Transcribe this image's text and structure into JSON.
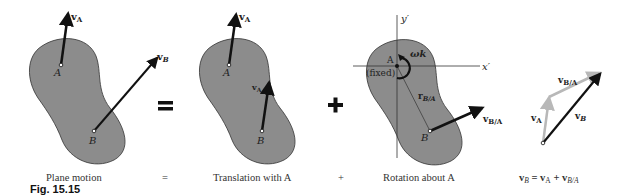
{
  "figure": {
    "number_label": "Fig. 15.15",
    "body_fill": "#8c8c8c",
    "arrow_color": "#111111",
    "gray_arrow_color": "#b8b8b8"
  },
  "panels": [
    {
      "caption": "Plane motion",
      "labels": {
        "point_a": "A",
        "point_b": "B",
        "va": "v",
        "va_sub": "A",
        "vb": "v",
        "vb_sub": "B"
      }
    },
    {
      "caption": "Translation with A",
      "labels": {
        "point_a": "A",
        "point_b": "B",
        "va": "v",
        "va_sub": "A",
        "va2": "v",
        "va2_sub": "A"
      }
    },
    {
      "caption": "Rotation about A",
      "labels": {
        "point_a": "A",
        "point_b": "B",
        "fixed": "(fixed)",
        "y_axis": "y′",
        "x_axis": "x′",
        "omega": "ωk",
        "r": "r",
        "r_sub": "B/A",
        "vba": "v",
        "vba_sub": "B/A"
      }
    },
    {
      "caption_main": "v",
      "caption_parts": [
        "B",
        " = v",
        "A",
        " + v",
        "B/A"
      ],
      "labels": {
        "vba": "v",
        "vba_sub": "B/A",
        "va": "v",
        "va_sub": "A",
        "vb": "v",
        "vb_sub": "B"
      }
    }
  ],
  "operators": {
    "equals": "=",
    "plus": "+",
    "equals_small": "=",
    "plus_small": "+"
  }
}
